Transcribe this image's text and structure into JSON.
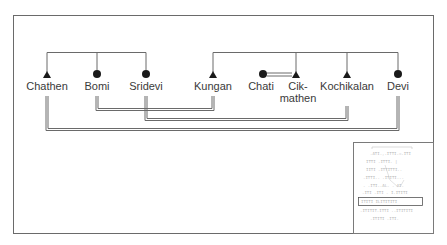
{
  "diagram": {
    "type": "kinship-chart",
    "legend": {
      "triangle": "male",
      "circle": "female",
      "single_line": "sibling/descent link",
      "double_line": "marriage"
    },
    "sibling_groups": [
      {
        "id": "group-left",
        "members": [
          {
            "name": "Chathen",
            "sex": "male",
            "x": 47
          },
          {
            "name": "Bomi",
            "sex": "female",
            "x": 97
          },
          {
            "name": "Sridevi",
            "sex": "female",
            "x": 146
          }
        ]
      },
      {
        "id": "group-right",
        "members": [
          {
            "name": "Kungan",
            "sex": "male",
            "x": 213
          },
          {
            "name": "Cik-",
            "name2": "mathen",
            "sex": "male",
            "x": 296
          },
          {
            "name": "Kochikalan",
            "sex": "male",
            "x": 347
          },
          {
            "name": "Devi",
            "sex": "female",
            "x": 398
          }
        ]
      }
    ],
    "outsider": {
      "name": "Chati",
      "sex": "female",
      "x": 263
    },
    "marriages": [
      {
        "from": "Bomi",
        "to": "Kungan"
      },
      {
        "from": "Sridevi",
        "to": "Kochikalan"
      },
      {
        "from": "Chathen",
        "to": "Devi"
      },
      {
        "from": "Chati",
        "to": "Cikmathen"
      }
    ],
    "inset": {
      "description": "thumbnail of larger kinship chart with highlighted row",
      "highlight_row": true
    },
    "colors": {
      "line": "#6a6a6a",
      "symbol": "#1a1a1a",
      "text": "#3a3a3a",
      "background": "#ffffff"
    }
  },
  "labels": {
    "chathen": "Chathen",
    "bomi": "Bomi",
    "sridevi": "Sridevi",
    "kungan": "Kungan",
    "chati": "Chati",
    "cikmathen_1": "Cik-",
    "cikmathen_2": "mathen",
    "kochikalan": "Kochikalan",
    "devi": "Devi"
  }
}
